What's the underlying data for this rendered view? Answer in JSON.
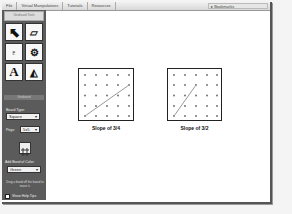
{
  "menubar": {
    "items": [
      "File",
      "Virtual Manipulatives",
      "Tutorials",
      "Resources"
    ],
    "bookmarks_label": "Bookmarks"
  },
  "sidebar": {
    "header": "Geoboard Tools",
    "tools": [
      {
        "name": "pointer-tool",
        "glyph": "➤"
      },
      {
        "name": "eraser-tool",
        "glyph": "⌫"
      },
      {
        "name": "paint-bucket-tool",
        "glyph": "🖌"
      },
      {
        "name": "stamp-tool",
        "glyph": "⚙"
      },
      {
        "name": "text-tool",
        "glyph": "A"
      },
      {
        "name": "shape-tool",
        "glyph": "◭"
      }
    ],
    "section_label": "Geoboard",
    "board_type_label": "Board Type:",
    "board_type_value": "Square",
    "pegs_label": "Pegs:",
    "pegs_value": "5x5",
    "band_color_label": "Add Band of Color:",
    "band_color_value": "Green",
    "description": "Drag a band off the board to erase it.",
    "help_tips_label": "Show Help Tips"
  },
  "boards": [
    {
      "caption": "Slope of 3/4",
      "pegs": 5,
      "line": {
        "from": [
          0,
          0
        ],
        "to": [
          4,
          3
        ]
      }
    },
    {
      "caption": "Slope of 3/2",
      "pegs": 5,
      "line": {
        "from": [
          0,
          0
        ],
        "to": [
          2,
          3
        ]
      }
    }
  ],
  "colors": {
    "sidebar_bg": "#5b5b5b",
    "band_color": "#999999",
    "peg_color": "#666666"
  }
}
